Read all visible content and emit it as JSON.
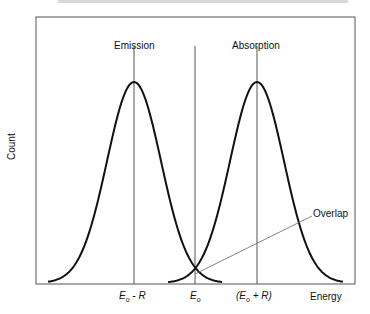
{
  "chart_data": {
    "type": "line",
    "title": "",
    "xlabel": "Energy",
    "ylabel": "Count",
    "grid": false,
    "x_tick_labels": [
      "E₀ - R",
      "E₀",
      "(E₀ + R)"
    ],
    "series": [
      {
        "name": "Emission",
        "center": "E₀ - R",
        "shape": "gaussian peak"
      },
      {
        "name": "Absorption",
        "center": "(E₀ + R)",
        "shape": "gaussian peak"
      }
    ],
    "annotations": [
      "Emission",
      "Absorption",
      "Overlap"
    ]
  },
  "labels": {
    "emission": "Emission",
    "absorption": "Absorption",
    "overlap": "Overlap",
    "ylabel": "Count",
    "xlabel": "Energy",
    "tick_left_main": "E",
    "tick_left_sub": "o",
    "tick_left_rest": " - R",
    "tick_center_main": "E",
    "tick_center_sub": "o",
    "tick_right_open": "(E",
    "tick_right_sub": "o",
    "tick_right_rest": " + R)"
  }
}
